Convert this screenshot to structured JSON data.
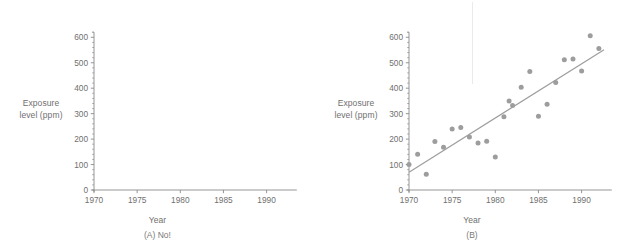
{
  "figure": {
    "panel_a": {
      "caption": "(A)  No!",
      "axis": {
        "ylabel_line1": "Exposure",
        "ylabel_line2": "level (ppm)",
        "xlabel": "Year",
        "yticks": [
          "0",
          "100",
          "200",
          "300",
          "400",
          "500",
          "600"
        ],
        "xticks": [
          "1970",
          "1975",
          "1980",
          "1985",
          "1990"
        ]
      }
    },
    "panel_b": {
      "caption": "(B)",
      "axis": {
        "ylabel_line1": "Exposure",
        "ylabel_line2": "level (ppm)",
        "xlabel": "Year",
        "yticks": [
          "0",
          "100",
          "200",
          "300",
          "400",
          "500",
          "600"
        ],
        "xticks": [
          "1970",
          "1975",
          "1980",
          "1985",
          "1990"
        ]
      }
    }
  },
  "colors": {
    "marker": "#9d9d9d",
    "line": "#9d9d9d",
    "axis": "#8a8a8a",
    "text": "#6f6f6f"
  },
  "chart_data": [
    {
      "type": "scatter",
      "panel": "A",
      "title": "",
      "subtitle": "(A)  No!",
      "xlabel": "Year",
      "ylabel": "Exposure level (ppm)",
      "xlim": [
        1969.0,
        1993.5
      ],
      "ylim": [
        0,
        640
      ],
      "xticks": [
        1970,
        1975,
        1980,
        1985,
        1990
      ],
      "yticks": [
        0,
        100,
        200,
        300,
        400,
        500,
        600
      ],
      "yminor_step": 20,
      "grid": false,
      "legend": "none",
      "x": [],
      "y": [],
      "note": "empty axes, no data plotted"
    },
    {
      "type": "scatter",
      "panel": "B",
      "title": "",
      "subtitle": "(B)",
      "xlabel": "Year",
      "ylabel": "Exposure level (ppm)",
      "xlim": [
        1969.0,
        1993.5
      ],
      "ylim": [
        0,
        640
      ],
      "xticks": [
        1970,
        1975,
        1980,
        1985,
        1990
      ],
      "yticks": [
        0,
        100,
        200,
        300,
        400,
        500,
        600
      ],
      "yminor_step": 20,
      "grid": false,
      "legend": "none",
      "x": [
        1970,
        1971,
        1972,
        1973,
        1974,
        1975,
        1976,
        1977,
        1978,
        1979,
        1980,
        1981,
        1981.6,
        1982,
        1983,
        1984,
        1985,
        1986,
        1987,
        1988,
        1989,
        1990,
        1991,
        1992
      ],
      "y": [
        100,
        140,
        62,
        191,
        168,
        240,
        246,
        208,
        185,
        192,
        130,
        288,
        350,
        332,
        404,
        466,
        290,
        337,
        422,
        512,
        515,
        468,
        606,
        556
      ],
      "fit_line": {
        "type": "line",
        "label": "least-squares fit",
        "x": [
          1970,
          1992.6
        ],
        "y": [
          70,
          551
        ]
      }
    }
  ]
}
